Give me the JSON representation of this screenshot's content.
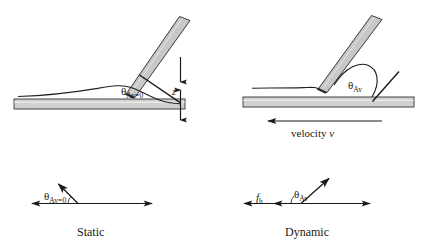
{
  "figure": {
    "colors": {
      "line": "#1a1a1a",
      "bar_fill": "#d0d0d0",
      "bar_stroke": "#444444",
      "cantilever_fill": "#c8c8c8",
      "cantilever_stroke": "#3a3a3a",
      "meniscus": "#222222",
      "background": "#ffffff"
    }
  },
  "panels": {
    "top_left": {
      "name": "static-schematic",
      "angle_label": {
        "symbol": "θ",
        "subscript": "Av=0"
      },
      "z_label": "z"
    },
    "top_right": {
      "name": "dynamic-schematic",
      "angle_label": {
        "symbol": "θ",
        "subscript": "Av"
      },
      "velocity_label": {
        "text": "velocity ",
        "symbol": "v"
      }
    },
    "bottom_left": {
      "name": "static-vector-diagram",
      "angle_label": {
        "symbol": "θ",
        "subscript": "Av=0"
      },
      "caption": "Static"
    },
    "bottom_right": {
      "name": "dynamic-vector-diagram",
      "angle_label": {
        "symbol": "θ",
        "subscript": "Av"
      },
      "friction_label": {
        "symbol": "f",
        "subscript": "h"
      },
      "caption": "Dynamic"
    }
  }
}
